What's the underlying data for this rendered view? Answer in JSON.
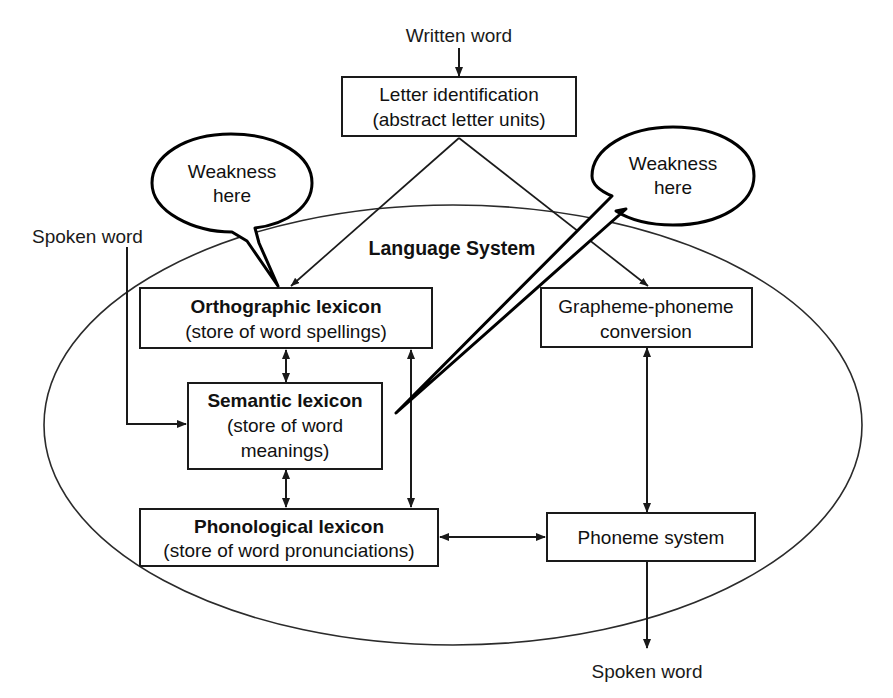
{
  "diagram": {
    "system_label": "Language System",
    "colors": {
      "ink": "#1a1a1a",
      "box_stroke": "#1a1a1a",
      "ellipse_stroke": "#2b2b2b",
      "bubble_stroke": "#000000",
      "background": "#ffffff"
    },
    "inputs": [
      {
        "id": "written-word",
        "label": "Written word"
      },
      {
        "id": "spoken-word-in",
        "label": "Spoken word"
      }
    ],
    "outputs": [
      {
        "id": "spoken-word-out",
        "label": "Spoken word"
      }
    ],
    "boxes": [
      {
        "id": "letter-identification",
        "line1": "Letter identification",
        "line2": "(abstract letter units)",
        "bold_line1": false
      },
      {
        "id": "orthographic-lexicon",
        "line1": "Orthographic lexicon",
        "line2": "(store of word spellings)",
        "bold_line1": true
      },
      {
        "id": "semantic-lexicon",
        "line1": "Semantic lexicon",
        "line2": "(store of word",
        "line3": "meanings)",
        "bold_line1": true
      },
      {
        "id": "phonological-lexicon",
        "line1": "Phonological lexicon",
        "line2": "(store of word pronunciations)",
        "bold_line1": true
      },
      {
        "id": "grapheme-phoneme-conversion",
        "line1": "Grapheme-phoneme",
        "line2": "conversion",
        "bold_line1": false
      },
      {
        "id": "phoneme-system",
        "line1": "Phoneme system",
        "bold_line1": false
      }
    ],
    "callouts": [
      {
        "id": "weakness-left",
        "line1": "Weakness",
        "line2": "here",
        "points_to": "orthographic-lexicon"
      },
      {
        "id": "weakness-right",
        "line1": "Weakness",
        "line2": "here",
        "points_to": "semantic-lexicon"
      }
    ],
    "connections": [
      {
        "from": "written-word",
        "to": "letter-identification",
        "type": "arrow"
      },
      {
        "from": "letter-identification",
        "to": "orthographic-lexicon",
        "type": "arrow"
      },
      {
        "from": "letter-identification",
        "to": "grapheme-phoneme-conversion",
        "type": "arrow"
      },
      {
        "from": "orthographic-lexicon",
        "to": "semantic-lexicon",
        "type": "double-arrow"
      },
      {
        "from": "semantic-lexicon",
        "to": "phonological-lexicon",
        "type": "double-arrow"
      },
      {
        "from": "orthographic-lexicon",
        "to": "phonological-lexicon",
        "type": "double-arrow"
      },
      {
        "from": "phonological-lexicon",
        "to": "phoneme-system",
        "type": "double-arrow"
      },
      {
        "from": "grapheme-phoneme-conversion",
        "to": "phoneme-system",
        "type": "double-arrow"
      },
      {
        "from": "spoken-word-in",
        "to": "semantic-lexicon",
        "type": "arrow"
      },
      {
        "from": "phoneme-system",
        "to": "spoken-word-out",
        "type": "arrow"
      }
    ]
  }
}
